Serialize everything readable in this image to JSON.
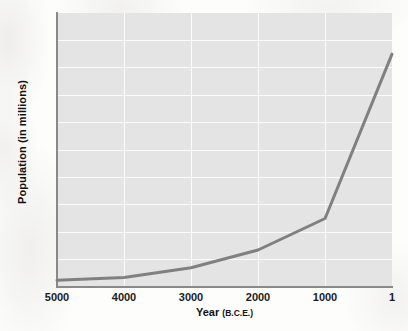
{
  "chart_data": {
    "type": "line",
    "title": "",
    "subtitle": "",
    "xlabel": "Year",
    "xlabel_sub": "(B.C.E.)",
    "xlabel_full": "Year (B.C.E.)",
    "ylabel": "Population (in millions)",
    "x": [
      5000,
      4000,
      3000,
      2000,
      1000,
      1
    ],
    "values": [
      5,
      7,
      14,
      27,
      50,
      170
    ],
    "series": [
      {
        "name": "World population",
        "values": [
          5,
          7,
          14,
          27,
          50,
          170
        ]
      }
    ],
    "x_ticks": [
      "5000",
      "4000",
      "3000",
      "2000",
      "1000",
      "1"
    ],
    "y_ticks": [
      "200",
      "180",
      "160",
      "140",
      "120",
      "100",
      "80",
      "60",
      "40",
      "20"
    ],
    "ylim": [
      0,
      200
    ],
    "xlim": [
      5000,
      1
    ],
    "x_reversed": true,
    "grid": true,
    "legend": false,
    "legend_position": "none",
    "line_color": "#808080",
    "plot_background": "#e4e4e4",
    "gridline_color": "#fbfbfb",
    "axis_color": "#8a8a8a",
    "page_background": "#fdfdfc"
  }
}
